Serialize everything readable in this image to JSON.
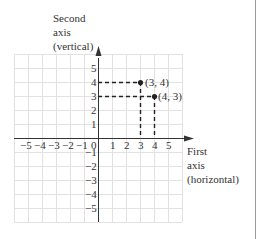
{
  "diagram": {
    "vertical_axis_label": [
      "Second",
      "axis",
      "(vertical)"
    ],
    "horizontal_axis_label": [
      "First",
      "axis",
      "(horizontal)"
    ],
    "x_ticks": [
      "−5",
      "−4",
      "−3",
      "−2",
      "−1",
      "0",
      "1",
      "2",
      "3",
      "4",
      "5"
    ],
    "y_ticks": [
      "5",
      "4",
      "3",
      "2",
      "1",
      "−1",
      "−2",
      "−3",
      "−4",
      "−5"
    ],
    "points": [
      {
        "label": "(3, 4)",
        "x": 3,
        "y": 4
      },
      {
        "label": "(4, 3)",
        "x": 4,
        "y": 3
      }
    ],
    "grid_range": {
      "x": [
        -6,
        6
      ],
      "y": [
        -6,
        6
      ]
    },
    "colors": {
      "grid": "#e2e2e2",
      "axis": "#333333",
      "point": "#222222",
      "frame": "#9a9a9a"
    }
  }
}
